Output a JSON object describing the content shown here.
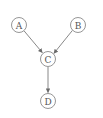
{
  "diagram": {
    "type": "directed-acyclic-graph",
    "colors": {
      "background": "#ffffff",
      "node_stroke": "#8a8a8a",
      "edge_stroke": "#7a7a7a",
      "label": "#555555"
    },
    "nodes": [
      {
        "id": "A",
        "label": "A",
        "x": 19,
        "y": 25
      },
      {
        "id": "B",
        "label": "B",
        "x": 78,
        "y": 25
      },
      {
        "id": "C",
        "label": "C",
        "x": 48,
        "y": 59
      },
      {
        "id": "D",
        "label": "D",
        "x": 48,
        "y": 101
      }
    ],
    "edges": [
      {
        "from": "A",
        "to": "C"
      },
      {
        "from": "B",
        "to": "C"
      },
      {
        "from": "C",
        "to": "D"
      }
    ]
  }
}
